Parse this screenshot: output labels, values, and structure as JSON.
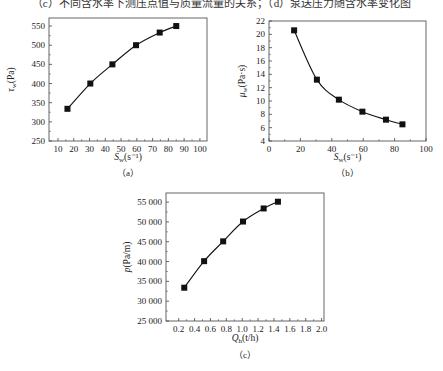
{
  "header": {
    "caption": "（c）不同含水率下测压点值与质量流量的关系；（d）泵送压力随含水率变化图"
  },
  "chart_data": [
    {
      "id": "a",
      "type": "line",
      "sub_caption": "（a）",
      "xlabel": "S_w(s⁻¹)",
      "xlabel_main": "S",
      "xlabel_sub": "w",
      "xlabel_rest": "(s⁻¹)",
      "ylabel": "τ_w(Pa)",
      "ylabel_main": "τ",
      "ylabel_sub": "w",
      "ylabel_rest": "(Pa)",
      "xlim": [
        4.3,
        104.5
      ],
      "ylim": [
        250,
        571
      ],
      "xticks": [
        10,
        20,
        30,
        40,
        50,
        60,
        70,
        80,
        90,
        100
      ],
      "yticks": [
        250,
        300,
        350,
        400,
        450,
        500,
        550
      ],
      "ytick_labels": [
        "250",
        "300",
        "350",
        "400",
        "450",
        "500",
        "550"
      ],
      "x": [
        16,
        30.5,
        44.5,
        59.5,
        74.5,
        85
      ],
      "series": [
        {
          "name": "τw",
          "values": [
            334,
            400,
            450,
            500,
            533,
            550
          ]
        }
      ],
      "grid": false,
      "marker": "square"
    },
    {
      "id": "b",
      "type": "line",
      "sub_caption": "（b）",
      "xlabel": "S_w(s⁻¹)",
      "xlabel_main": "S",
      "xlabel_sub": "w",
      "xlabel_rest": "(s⁻¹)",
      "ylabel": "μ_w(Pa·s)",
      "ylabel_main": "μ",
      "ylabel_sub": "w",
      "ylabel_rest": "(Pa·s)",
      "xlim": [
        0,
        100
      ],
      "ylim": [
        4,
        22
      ],
      "xticks": [
        0,
        20,
        40,
        60,
        80,
        100
      ],
      "yticks": [
        4,
        6,
        8,
        10,
        12,
        14,
        16,
        18,
        20,
        22
      ],
      "ytick_labels": [
        "4",
        "6",
        "8",
        "10",
        "12",
        "14",
        "16",
        "18",
        "20",
        "22"
      ],
      "x": [
        16,
        30.5,
        44.5,
        59.5,
        74.5,
        85
      ],
      "series": [
        {
          "name": "μw",
          "values": [
            20.6,
            13.2,
            10.2,
            8.4,
            7.2,
            6.5
          ]
        }
      ],
      "grid": false,
      "marker": "square"
    },
    {
      "id": "c",
      "type": "line",
      "sub_caption": "（c）",
      "xlabel": "Q_h(t/h)",
      "xlabel_main": "Q",
      "xlabel_sub": "h",
      "xlabel_rest": "(t/h)",
      "ylabel": "p(Pa/m)",
      "ylabel_main": "p",
      "ylabel_sub": "",
      "ylabel_rest": "(Pa/m)",
      "xlim": [
        0.04,
        2.03
      ],
      "ylim": [
        25000,
        57300
      ],
      "xticks": [
        0.2,
        0.4,
        0.6,
        0.8,
        1.0,
        1.2,
        1.4,
        1.6,
        1.8,
        2.0
      ],
      "xtick_labels": [
        "0.2",
        "0.4",
        "0.6",
        "0.8",
        "1.0",
        "1.2",
        "1.4",
        "1.6",
        "1.8",
        "2.0"
      ],
      "yticks": [
        25000,
        30000,
        35000,
        40000,
        45000,
        50000,
        55000
      ],
      "ytick_labels": [
        "25 000",
        "30 000",
        "35 000",
        "40 000",
        "45 000",
        "50 000",
        "55 000"
      ],
      "x": [
        0.27,
        0.52,
        0.76,
        1.01,
        1.27,
        1.45
      ],
      "series": [
        {
          "name": "p",
          "values": [
            33400,
            40100,
            45100,
            50100,
            53400,
            55100
          ]
        }
      ],
      "grid": false,
      "marker": "square"
    }
  ]
}
